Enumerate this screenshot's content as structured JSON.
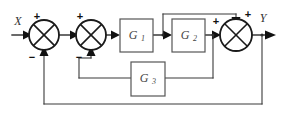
{
  "diagram": {
    "type": "control-block-diagram",
    "canvas": {
      "width": 282,
      "height": 119,
      "background": "#ffffff"
    },
    "io": {
      "input_label": "X",
      "output_label": "Y"
    },
    "blocks": [
      {
        "id": "G1",
        "label": "G",
        "subscript": "1",
        "x": 120,
        "y": 19,
        "w": 33,
        "h": 33
      },
      {
        "id": "G2",
        "label": "G",
        "subscript": "2",
        "x": 172,
        "y": 19,
        "w": 33,
        "h": 33
      },
      {
        "id": "G3",
        "label": "G",
        "subscript": "3",
        "x": 131,
        "y": 62,
        "w": 34,
        "h": 34
      }
    ],
    "summing_junctions": [
      {
        "id": "sum1",
        "cx": 44,
        "cy": 35,
        "r": 15,
        "signs": {
          "left": "+",
          "bottom": "−"
        }
      },
      {
        "id": "sum2",
        "cx": 91,
        "cy": 35,
        "r": 15,
        "signs": {
          "top_left": "+",
          "bottom": "−"
        }
      },
      {
        "id": "sum3",
        "cx": 236,
        "cy": 35,
        "r": 16,
        "signs": {
          "left": "+",
          "top": "+"
        }
      }
    ],
    "signs": {
      "plus": "+",
      "minus": "−"
    },
    "paths": [
      {
        "id": "input-path",
        "from": "X",
        "to": "sum1"
      },
      {
        "id": "sum1-to-sum2",
        "from": "sum1",
        "to": "sum2"
      },
      {
        "id": "sum2-to-G1",
        "from": "sum2",
        "to": "G1"
      },
      {
        "id": "G1-to-G2",
        "from": "G1",
        "to": "G2"
      },
      {
        "id": "feedforward-top",
        "from": "G1-output",
        "to": "sum3-top"
      },
      {
        "id": "G2-to-sum3",
        "from": "G2",
        "to": "sum3"
      },
      {
        "id": "sum3-to-Y",
        "from": "sum3",
        "to": "Y"
      },
      {
        "id": "inner-feedback-G3",
        "from": "G2-output",
        "to": "sum2-bottom",
        "through": "G3"
      },
      {
        "id": "outer-feedback",
        "from": "Y",
        "to": "sum1-bottom"
      }
    ],
    "colors": {
      "wire": "#3a3a3a",
      "block_stroke": "#555555",
      "junction_stroke": "#1a1a1a",
      "label_text": "#444444",
      "background": "#ffffff"
    }
  }
}
